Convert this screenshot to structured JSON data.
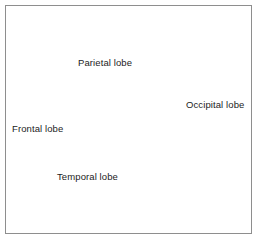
{
  "figure": {
    "background_color": "#ffffff",
    "border_color": "#8e8e8e"
  },
  "labels": {
    "parietal": "Parietal lobe",
    "frontal": "Frontal lobe",
    "occipital": "Occipital lobe",
    "temporal": "Temporal lobe"
  },
  "anatomy": {
    "cortex_fill": "#c9c9c9",
    "cortex_light": "#e2e2e2",
    "cortex_shadow": "#9a9a9a",
    "occipital_fill": "#8f8f8f",
    "cerebellum_fill": "#1a1a1a",
    "brainstem_fill": "#bdbdbd",
    "outline_color": "#111111",
    "parts": [
      "frontal-lobe",
      "parietal-lobe",
      "occipital-lobe",
      "temporal-lobe",
      "cerebellum",
      "brainstem"
    ]
  }
}
